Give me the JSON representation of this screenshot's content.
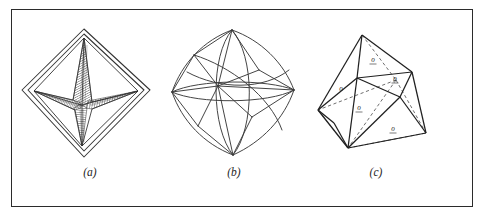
{
  "plate": {
    "background_color": "#ffffff",
    "frame_color": "#2b2b2b",
    "ink_color": "#222222"
  },
  "figures": [
    {
      "id": "a",
      "caption": "(a)",
      "name": "octahedron-skeletal-star",
      "description": "Octahedron drawn in outline with an internal four-armed hatched star figure",
      "label_count": 0
    },
    {
      "id": "b",
      "caption": "(b)",
      "name": "spherical-octahedron",
      "description": "Octahedron projected on a sphere with great-circle arcs forming curved triangular faces",
      "label_count": 0
    },
    {
      "id": "c",
      "caption": "(c)",
      "name": "octahedron-clinographic",
      "description": "Octahedron in clinographic projection with dashed hidden edges and lettered faces",
      "face_labels": [
        "o",
        "o",
        "o",
        "o",
        "o"
      ]
    }
  ],
  "captions": {
    "a": "(a)",
    "b": "(b)",
    "c": "(c)"
  },
  "face_label_text": "o"
}
